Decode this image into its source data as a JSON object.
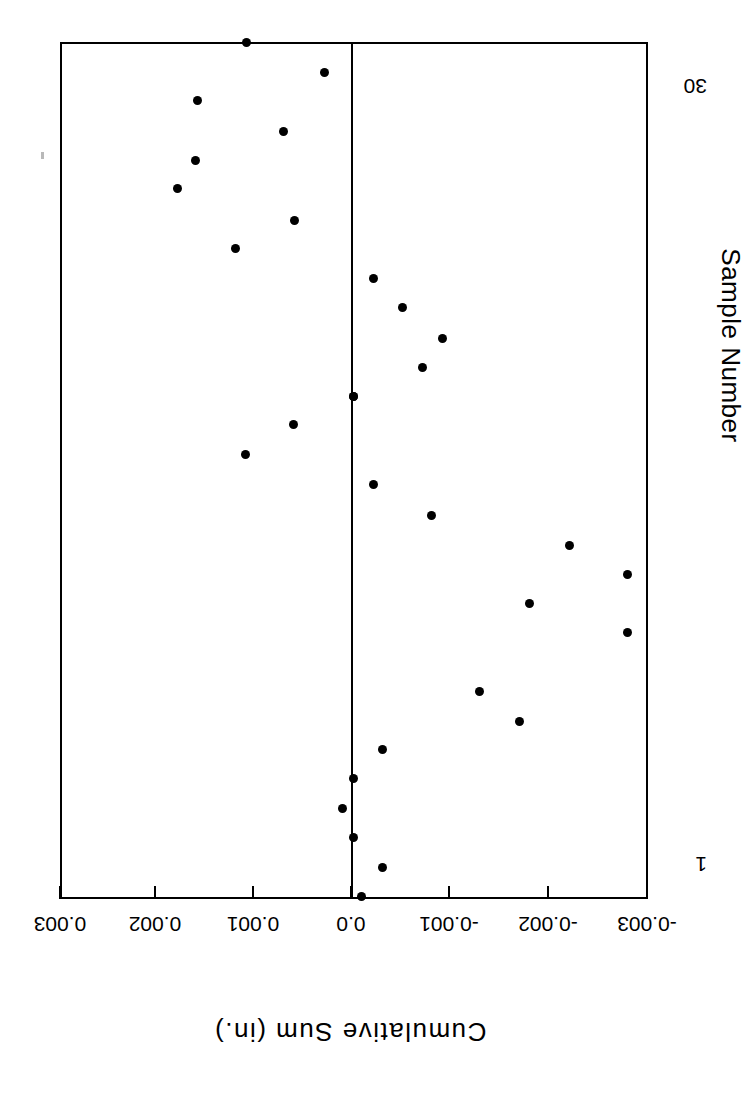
{
  "chart_data": {
    "type": "scatter",
    "title": "",
    "xlabel": "Sample Number",
    "ylabel": "Cumulative Sum (in.)",
    "orientation": "rotated-90",
    "grid": false,
    "legend": null,
    "xlim": [
      1,
      30
    ],
    "ylim": [
      -0.003,
      0.003
    ],
    "xticklabels": [
      "1",
      "30"
    ],
    "xticks": [
      1,
      30
    ],
    "yticklabels": [
      "0.003",
      "0.002",
      "0.001",
      "0.0",
      "-0.001",
      "-0.002",
      "-0.003"
    ],
    "yticks": [
      0.003,
      0.002,
      0.001,
      0.0,
      -0.001,
      -0.002,
      -0.003
    ],
    "reference_line": 0.0,
    "x": [
      1,
      2,
      3,
      4,
      5,
      6,
      7,
      8,
      9,
      10,
      11,
      12,
      13,
      14,
      15,
      16,
      17,
      18,
      19,
      20,
      21,
      22,
      23,
      24,
      25,
      26,
      27,
      28,
      29,
      30
    ],
    "values": [
      -0.0001,
      -0.00031,
      -2e-05,
      9e-05,
      -2e-05,
      -0.00031,
      -0.0017,
      -0.0013,
      -0.0028,
      -0.0018,
      -0.0028,
      -0.0022,
      -0.0008,
      -0.00022,
      0.00108,
      0.00059,
      0.0,
      -0.00072,
      -0.00092,
      -0.00052,
      -0.00022,
      0.00118,
      0.00058,
      0.00177,
      0.00158,
      0.00069,
      0.00156,
      0.00027,
      0.00107,
      0.0
    ],
    "points": [
      {
        "n": 1,
        "value": -0.0001,
        "px": 361,
        "py": 896
      },
      {
        "n": 2,
        "value": -0.00031,
        "px": 382,
        "py": 867
      },
      {
        "n": 3,
        "value": -2e-05,
        "px": 353,
        "py": 837
      },
      {
        "n": 4,
        "value": 9e-05,
        "px": 342,
        "py": 808
      },
      {
        "n": 5,
        "value": -2e-05,
        "px": 353,
        "py": 778
      },
      {
        "n": 6,
        "value": -0.00031,
        "px": 382,
        "py": 749
      },
      {
        "n": 7,
        "value": -0.0017,
        "px": 519,
        "py": 721
      },
      {
        "n": 8,
        "value": -0.0013,
        "px": 479,
        "py": 691
      },
      {
        "n": 9,
        "value": -0.0028,
        "px": 627,
        "py": 632
      },
      {
        "n": 10,
        "value": -0.0018,
        "px": 529,
        "py": 603
      },
      {
        "n": 11,
        "value": -0.0028,
        "px": 627,
        "py": 574
      },
      {
        "n": 12,
        "value": -0.0022,
        "px": 569,
        "py": 545
      },
      {
        "n": 13,
        "value": -0.0008,
        "px": 431,
        "py": 515
      },
      {
        "n": 14,
        "value": -0.00022,
        "px": 373,
        "py": 484
      },
      {
        "n": 15,
        "value": 0.00108,
        "px": 245,
        "py": 454
      },
      {
        "n": 16,
        "value": 0.00059,
        "px": 293,
        "py": 424
      },
      {
        "n": 17,
        "value": 0.0,
        "px": 353,
        "py": 396
      },
      {
        "n": 18,
        "value": -0.00072,
        "px": 422,
        "py": 367
      },
      {
        "n": 19,
        "value": -0.00092,
        "px": 442,
        "py": 338
      },
      {
        "n": 20,
        "value": -0.00052,
        "px": 402,
        "py": 307
      },
      {
        "n": 21,
        "value": -0.00022,
        "px": 373,
        "py": 278
      },
      {
        "n": 22,
        "value": 0.00118,
        "px": 235,
        "py": 248
      },
      {
        "n": 23,
        "value": 0.00058,
        "px": 294,
        "py": 220
      },
      {
        "n": 24,
        "value": 0.00177,
        "px": 177,
        "py": 188
      },
      {
        "n": 25,
        "value": 0.00158,
        "px": 195,
        "py": 160
      },
      {
        "n": 26,
        "value": 0.00069,
        "px": 283,
        "py": 131
      },
      {
        "n": 27,
        "value": 0.00156,
        "px": 197,
        "py": 100
      },
      {
        "n": 28,
        "value": 0.00027,
        "px": 324,
        "py": 72
      },
      {
        "n": 29,
        "value": 0.00107,
        "px": 246,
        "py": 42
      },
      {
        "n": 30,
        "value": 0.0,
        "px": 353,
        "py": 396
      }
    ]
  },
  "axes": {
    "value_axis": {
      "title": "Cumulative Sum (in.)",
      "ticks": [
        {
          "label": "0.003",
          "px": 60
        },
        {
          "label": "0.002",
          "px": 155
        },
        {
          "label": "0.001",
          "px": 253
        },
        {
          "label": "0.0",
          "px": 351
        },
        {
          "label": "-0.001",
          "px": 449
        },
        {
          "label": "-0.002",
          "px": 548
        },
        {
          "label": "-0.003",
          "px": 647
        }
      ]
    },
    "sample_axis": {
      "title": "Sample Number",
      "ticks": [
        {
          "label": "1",
          "py": 866
        },
        {
          "label": "30",
          "py": 88
        }
      ]
    }
  },
  "style": {
    "marker_color": "#000000",
    "axis_color": "#000000",
    "background": "#ffffff"
  }
}
